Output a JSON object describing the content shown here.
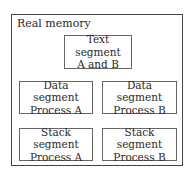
{
  "diagram": {
    "title": "Real memory",
    "segments": [
      {
        "line1": "Text segment",
        "line2": "A and B"
      },
      {
        "line1": "Data segment",
        "line2": "Process A"
      },
      {
        "line1": "Data segment",
        "line2": "Process B"
      },
      {
        "line1": "Stack segment",
        "line2": "Process A"
      },
      {
        "line1": "Stack segment",
        "line2": "Process B"
      }
    ]
  }
}
